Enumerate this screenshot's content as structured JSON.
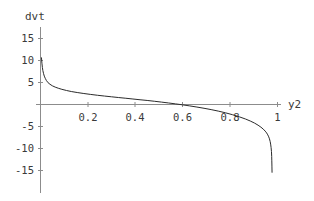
{
  "chart_data": {
    "type": "line",
    "title": "",
    "xlabel": "y2",
    "ylabel": "dvt",
    "xlim": [
      0,
      1.03
    ],
    "ylim": [
      -17,
      17
    ],
    "grid": false,
    "legend": null,
    "x_ticks": [
      {
        "value": 0.2,
        "label": "0.2"
      },
      {
        "value": 0.4,
        "label": "0.4"
      },
      {
        "value": 0.6,
        "label": "0.6"
      },
      {
        "value": 0.8,
        "label": "0.8"
      },
      {
        "value": 1.0,
        "label": "1"
      }
    ],
    "y_ticks": [
      {
        "value": 15,
        "label": "15"
      },
      {
        "value": 10,
        "label": "10"
      },
      {
        "value": 5,
        "label": "5"
      },
      {
        "value": -5,
        "label": "-5"
      },
      {
        "value": -10,
        "label": "-10"
      },
      {
        "value": -15,
        "label": "-15"
      }
    ],
    "series": [
      {
        "name": "dvt",
        "color": "#2b2b2b",
        "x": [
          0.004,
          0.006,
          0.008,
          0.01,
          0.013,
          0.016,
          0.02,
          0.025,
          0.032,
          0.04,
          0.05,
          0.062,
          0.075,
          0.09,
          0.11,
          0.13,
          0.155,
          0.18,
          0.21,
          0.24,
          0.27,
          0.3,
          0.33,
          0.36,
          0.39,
          0.42,
          0.45,
          0.48,
          0.51,
          0.54,
          0.57,
          0.6,
          0.63,
          0.66,
          0.69,
          0.72,
          0.75,
          0.78,
          0.81,
          0.84,
          0.865,
          0.885,
          0.903,
          0.918,
          0.93,
          0.94,
          0.948,
          0.954,
          0.959,
          0.963,
          0.966,
          0.969,
          0.971,
          0.973,
          0.9745,
          0.9755,
          0.976,
          0.9765,
          0.977
        ],
        "y": [
          10.7,
          9.4,
          8.4,
          7.7,
          7.0,
          6.45,
          5.95,
          5.45,
          4.95,
          4.6,
          4.25,
          3.95,
          3.7,
          3.45,
          3.18,
          2.95,
          2.72,
          2.52,
          2.3,
          2.1,
          1.92,
          1.75,
          1.58,
          1.42,
          1.25,
          1.08,
          0.92,
          0.74,
          0.55,
          0.35,
          0.14,
          -0.08,
          -0.32,
          -0.58,
          -0.86,
          -1.16,
          -1.5,
          -1.88,
          -2.32,
          -2.82,
          -3.3,
          -3.75,
          -4.22,
          -4.7,
          -5.15,
          -5.6,
          -6.05,
          -6.45,
          -6.9,
          -7.35,
          -7.8,
          -8.4,
          -9.0,
          -9.8,
          -10.7,
          -11.8,
          -12.8,
          -14.0,
          -15.5
        ]
      }
    ],
    "annotations": []
  },
  "axes": {
    "y_axis_label": "dvt",
    "x_axis_label": "y2"
  }
}
